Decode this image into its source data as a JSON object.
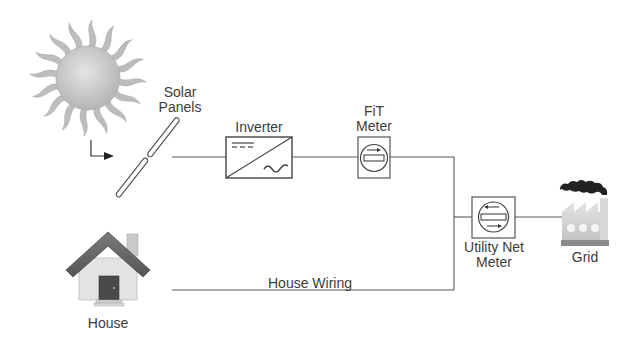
{
  "diagram": {
    "nodes": {
      "sun": {
        "label": ""
      },
      "solar_panels": {
        "label_line1": "Solar",
        "label_line2": "Panels"
      },
      "inverter": {
        "label": "Inverter"
      },
      "fit_meter": {
        "label_line1": "FiT",
        "label_line2": "Meter"
      },
      "utility_meter": {
        "label_line1": "Utility Net",
        "label_line2": "Meter"
      },
      "grid": {
        "label": "Grid"
      },
      "house": {
        "label": "House"
      }
    },
    "edges": [
      {
        "from": "sun",
        "to": "solar_panels",
        "label": ""
      },
      {
        "from": "solar_panels",
        "to": "inverter",
        "label": ""
      },
      {
        "from": "inverter",
        "to": "fit_meter",
        "label": ""
      },
      {
        "from": "fit_meter",
        "to": "utility_meter",
        "label": ""
      },
      {
        "from": "utility_meter",
        "to": "grid",
        "label": ""
      },
      {
        "from": "house",
        "to": "utility_meter",
        "label": "House Wiring"
      }
    ],
    "house_wiring_label": "House Wiring",
    "colors": {
      "line": "#555555",
      "sun": "#b9b9b9",
      "roof": "#6a6a6a",
      "wall": "#e2e2e2",
      "door": "#4a4a4a",
      "smoke": "#222222",
      "factory": "#cfcfcf"
    }
  }
}
